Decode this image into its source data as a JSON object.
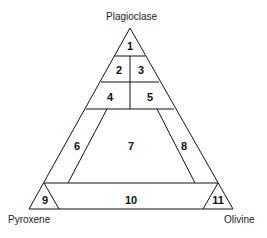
{
  "diagram": {
    "vertices": {
      "top": "Plagioclase",
      "left": "Pyroxene",
      "right": "Olivine"
    },
    "fields": [
      "1",
      "2",
      "3",
      "4",
      "5",
      "6",
      "7",
      "8",
      "9",
      "10",
      "11"
    ],
    "line_color": "#111111",
    "background": "#ffffff"
  }
}
